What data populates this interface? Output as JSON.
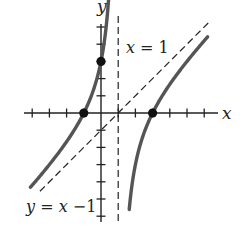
{
  "chart_data": {
    "type": "line",
    "title": "",
    "xlabel": "x",
    "ylabel": "y",
    "xlim": [
      -4,
      7
    ],
    "ylim": [
      -6,
      5
    ],
    "grid": false,
    "x_ticks": [
      -4,
      -3,
      -2,
      -1,
      1,
      2,
      3,
      4,
      5,
      6
    ],
    "y_ticks": [
      -6,
      -5,
      -4,
      -3,
      -2,
      -1,
      1,
      2,
      3,
      4,
      5
    ],
    "function": "f(x) = (x^2 - 2x - 3)/(x - 1) = x - 1 - 4/(x - 1)",
    "series": [
      {
        "name": "left branch",
        "style": "solid-gray-thick",
        "x": [
          -4.1,
          -3,
          -2,
          -1,
          -0.5,
          0,
          0.3,
          0.45
        ],
        "y": [
          -4.32,
          -3.0,
          -1.67,
          0.0,
          1.17,
          3.0,
          5.01,
          6.72
        ]
      },
      {
        "name": "right branch",
        "style": "solid-gray-thick",
        "x": [
          1.65,
          2,
          3,
          4,
          5,
          6.2
        ],
        "y": [
          -6.5,
          -3.0,
          0.0,
          1.67,
          3.0,
          4.43
        ]
      }
    ],
    "asymptotes": [
      {
        "type": "vertical",
        "equation": "x = 1",
        "label": "x = 1",
        "style": "dashed"
      },
      {
        "type": "slant",
        "equation": "y = x - 1",
        "label": "y = x −1",
        "style": "dashed"
      }
    ],
    "points": [
      {
        "x": -1,
        "y": 0,
        "label": "x-intercept"
      },
      {
        "x": 3,
        "y": 0,
        "label": "x-intercept"
      },
      {
        "x": 0,
        "y": 3,
        "label": "y-intercept"
      }
    ],
    "annotations": [
      {
        "text": "x = 1",
        "position": "right of vertical asymptote, upper"
      },
      {
        "text": "y = x −1",
        "position": "lower left, below slant asymptote"
      }
    ],
    "legend": null
  },
  "labels": {
    "x_axis": "x",
    "y_axis": "y",
    "vertical_asymptote_var": "x",
    "vertical_asymptote_rest": " = 1",
    "slant_asymptote_y": "y",
    "slant_asymptote_mid": " = ",
    "slant_asymptote_x": "x",
    "slant_asymptote_rest": " −1"
  },
  "colors": {
    "curve": "#555555",
    "axis": "#222222",
    "asymptote": "#222222",
    "point": "#111111"
  }
}
